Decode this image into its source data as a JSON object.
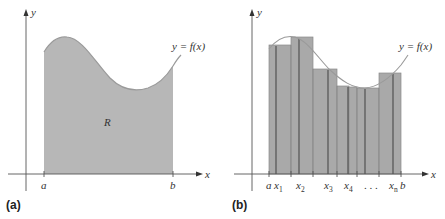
{
  "colors": {
    "fill_region": "#b7b7b7",
    "bar_fill": "#a9a9a9",
    "bar_edge": "#8a8a8a",
    "sample_line": "#4a4a4a",
    "curve": "#9a9a9a",
    "axis": "#555555",
    "text": "#333333"
  },
  "panel_a": {
    "label": "(a)",
    "axis_x_label": "x",
    "axis_y_label": "y",
    "curve_label": "y = f(x)",
    "region_label": "R",
    "tick_a": "a",
    "tick_b": "b"
  },
  "panel_b": {
    "label": "(b)",
    "axis_x_label": "x",
    "axis_y_label": "y",
    "curve_label": "y = f(x)",
    "tick_a": "a",
    "tick_b": "b",
    "sample_labels": [
      {
        "base": "x",
        "sub": "1"
      },
      {
        "base": "x",
        "sub": "2"
      },
      {
        "base": "x",
        "sub": "3"
      },
      {
        "base": "x",
        "sub": "4"
      },
      {
        "base": "x",
        "sub": "n"
      }
    ],
    "ellipsis": ". . ."
  }
}
